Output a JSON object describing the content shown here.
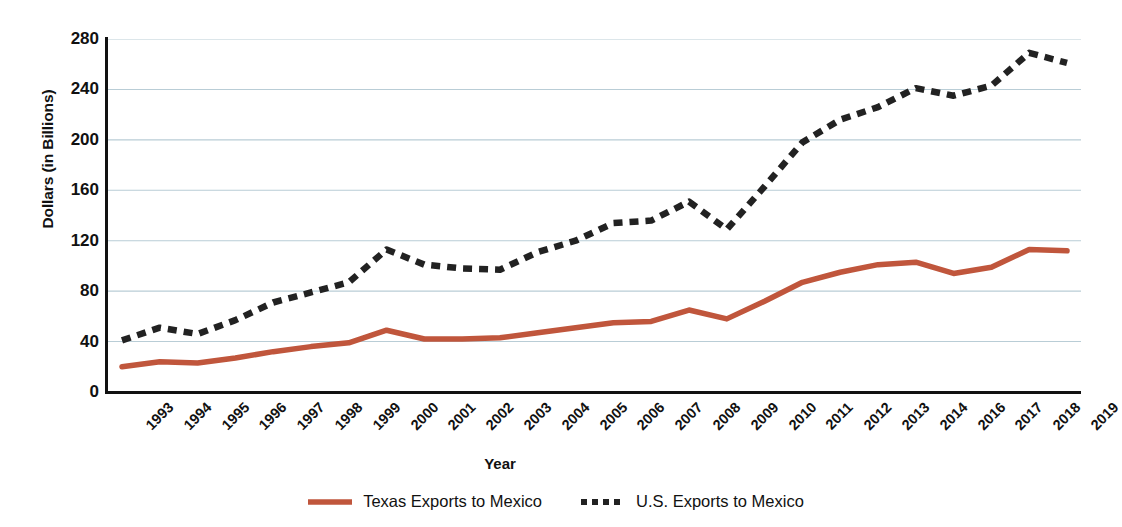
{
  "chart_data": {
    "type": "line",
    "title": "",
    "xlabel": "Year",
    "ylabel": "Dollars (in Billions)",
    "ylim": [
      0,
      280
    ],
    "yticks": [
      0,
      40,
      80,
      120,
      160,
      200,
      240,
      280
    ],
    "ytick_labels": [
      "0",
      "40",
      "80",
      "120",
      "160",
      "200",
      "240",
      "280"
    ],
    "grid": "horizontal",
    "legend_position": "bottom-center",
    "categories": [
      "1993",
      "1994",
      "1995",
      "1996",
      "1997",
      "1998",
      "1999",
      "2000",
      "2001",
      "2002",
      "2003",
      "2004",
      "2005",
      "2006",
      "2007",
      "2008",
      "2009",
      "2010",
      "2011",
      "2012",
      "2013",
      "2014",
      "2016",
      "2017",
      "2018",
      "2019"
    ],
    "series": [
      {
        "name": "Texas Exports to Mexico",
        "style": "solid",
        "color": "#C0563C",
        "values": [
          20,
          24,
          23,
          27,
          32,
          36,
          39,
          49,
          42,
          42,
          43,
          47,
          51,
          55,
          56,
          65,
          58,
          72,
          87,
          95,
          101,
          103,
          94,
          99,
          113,
          112
        ]
      },
      {
        "name": "U.S. Exports to Mexico",
        "style": "dashed",
        "color": "#222222",
        "values": [
          41,
          51,
          46,
          57,
          71,
          79,
          87,
          113,
          101,
          98,
          97,
          111,
          120,
          134,
          136,
          151,
          129,
          163,
          198,
          216,
          226,
          241,
          235,
          243,
          269,
          261
        ]
      }
    ]
  },
  "legend": {
    "entries": [
      {
        "label": "Texas Exports to Mexico",
        "swatch": "solid-line-swatch"
      },
      {
        "label": "U.S. Exports to Mexico",
        "swatch": "dashed-line-swatch"
      }
    ]
  },
  "colors": {
    "texas_line": "#C0563C",
    "us_line": "#222222",
    "gridline": "#b9cdd6",
    "axis": "#111111"
  }
}
